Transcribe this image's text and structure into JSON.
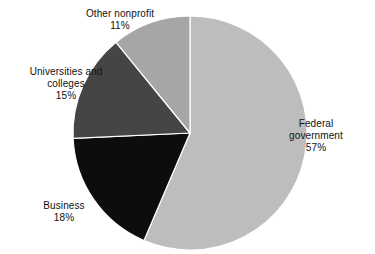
{
  "chart_data": {
    "type": "pie",
    "title": "",
    "subtitle": "",
    "xlabel": "",
    "ylabel": "",
    "legend_position": "none",
    "grid": false,
    "labels_inline": true,
    "start_angle_deg": 0,
    "direction": "clockwise",
    "units": "percent",
    "categories": [
      "Federal government",
      "Business",
      "Universities and colleges",
      "Other nonprofit"
    ],
    "values": [
      57,
      18,
      15,
      11
    ],
    "slices": [
      {
        "label": "Federal government",
        "label_line1": "Federal",
        "label_line2": "government",
        "value": 57,
        "value_text": "57%",
        "color": "#bdbdbd"
      },
      {
        "label": "Business",
        "label_line1": "Business",
        "label_line2": "",
        "value": 18,
        "value_text": "18%",
        "color": "#0d0d0d"
      },
      {
        "label": "Universities and colleges",
        "label_line1": "Universities and",
        "label_line2": "colleges",
        "value": 15,
        "value_text": "15%",
        "color": "#454545"
      },
      {
        "label": "Other nonprofit",
        "label_line1": "Other nonprofit",
        "label_line2": "",
        "value": 11,
        "value_text": "11%",
        "color": "#a6a6a6"
      }
    ],
    "geometry": {
      "center_x": 190,
      "center_y": 133,
      "radius": 117
    },
    "background_color": "#ffffff",
    "separator_color": "#ffffff"
  }
}
